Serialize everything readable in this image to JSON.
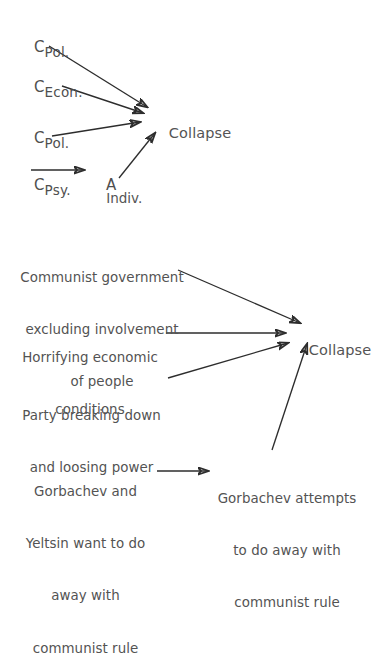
{
  "page": {
    "running_header": "IN A CASE STUDY IN CAUSAL REASONING",
    "background_color": "#ffffff",
    "ink_color": "#535353",
    "arrow_color": "#2d2d2d"
  },
  "diagram_1": {
    "name": "abstract-causal-model",
    "causes": [
      {
        "id": "c-pol-1",
        "symbol": "C",
        "subscript": "Pol."
      },
      {
        "id": "c-econ",
        "symbol": "C",
        "subscript": "Econ."
      },
      {
        "id": "c-pol-2",
        "symbol": "C",
        "subscript": "Pol."
      },
      {
        "id": "c-psy",
        "symbol": "C",
        "subscript": "Psy."
      }
    ],
    "mediator": {
      "id": "a-indiv",
      "symbol": "A",
      "subscript": "Indiv."
    },
    "effect": {
      "id": "collapse-1",
      "label": "Collapse"
    },
    "edges": [
      {
        "from": "c-pol-1",
        "to": "collapse-1"
      },
      {
        "from": "c-econ",
        "to": "collapse-1"
      },
      {
        "from": "c-pol-2",
        "to": "collapse-1"
      },
      {
        "from": "c-psy",
        "to": "a-indiv"
      },
      {
        "from": "a-indiv",
        "to": "collapse-1"
      }
    ]
  },
  "diagram_2": {
    "name": "concrete-causal-model",
    "causes": [
      {
        "id": "communist-government",
        "lines": [
          "Communist government",
          "excluding involvement",
          "of people"
        ],
        "align": "center"
      },
      {
        "id": "horrifying-economic-conditions",
        "lines": [
          "Horrifying economic",
          "conditions"
        ],
        "align": "center"
      },
      {
        "id": "party-breaking-down",
        "lines": [
          "Party breaking down",
          "and loosing power"
        ],
        "align": "center"
      },
      {
        "id": "gorbachev-yeltsin-want",
        "lines": [
          "Gorbachev and",
          "Yeltsin want to do",
          "away with",
          "communist rule"
        ],
        "align": "center"
      }
    ],
    "mediator": {
      "id": "gorbachev-attempts",
      "lines": [
        "Gorbachev attempts",
        "to do away with",
        "communist rule"
      ],
      "align": "center"
    },
    "effect": {
      "id": "collapse-2",
      "label": "Collapse"
    },
    "edges": [
      {
        "from": "communist-government",
        "to": "collapse-2"
      },
      {
        "from": "horrifying-economic-conditions",
        "to": "collapse-2"
      },
      {
        "from": "party-breaking-down",
        "to": "collapse-2"
      },
      {
        "from": "gorbachev-yeltsin-want",
        "to": "gorbachev-attempts"
      },
      {
        "from": "gorbachev-attempts",
        "to": "collapse-2"
      }
    ]
  }
}
